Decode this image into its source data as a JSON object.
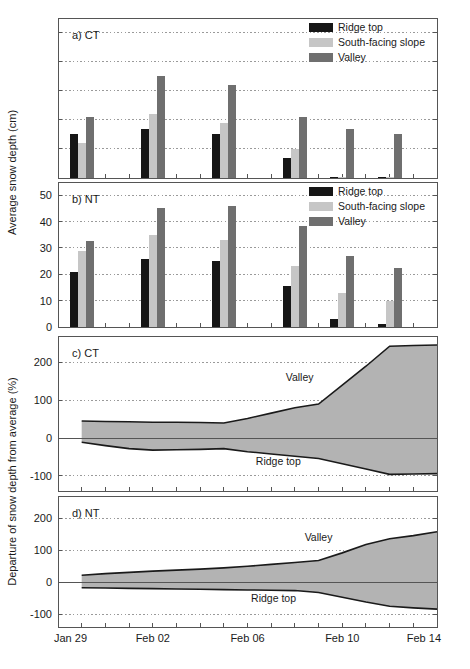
{
  "figure": {
    "width": 470,
    "height": 669,
    "ylabel_top": "Average snow depth (cm)",
    "ylabel_bottom": "Departure of snow depth from average (%)",
    "x_tick_labels": [
      "Jan 29",
      "Feb 02",
      "Feb 06",
      "Feb 10",
      "Feb 14"
    ],
    "x_tick_days": [
      0,
      4,
      8,
      12,
      16
    ],
    "x_range": [
      0,
      16
    ]
  },
  "colors": {
    "ridge_top": "#161616",
    "south_facing_slope": "#c6c6c6",
    "valley": "#6f6f6f",
    "band_fill": "#b3b3b3",
    "band_line": "#1a1a1a",
    "frame": "#555555",
    "grid": "#9a9a9a",
    "zero_line": "#555555"
  },
  "legend": {
    "entries": [
      {
        "label": "Ridge top",
        "color_key": "ridge_top"
      },
      {
        "label": "South-facing slope",
        "color_key": "south_facing_slope"
      },
      {
        "label": "Valley",
        "color_key": "valley"
      }
    ]
  },
  "chart_data": [
    {
      "id": "panel-a",
      "type": "bar",
      "title": "a) CT",
      "panel_label": "a) CT",
      "xlabel": "",
      "ylabel": "Average snow depth (cm)",
      "ylim": [
        0,
        55
      ],
      "yticks": [
        0,
        10,
        20,
        30,
        40,
        50
      ],
      "ytick_labels_visible": false,
      "grid": true,
      "legend_position": "top-right",
      "categories": [
        "Jan 30",
        "Feb 02",
        "Feb 05",
        "Feb 08",
        "Feb 11",
        "Feb 13"
      ],
      "category_days": [
        1,
        4,
        7,
        10,
        12,
        14
      ],
      "series": [
        {
          "name": "Ridge top",
          "color_key": "ridge_top",
          "values": [
            15,
            17,
            15,
            7,
            0.4,
            0.5
          ]
        },
        {
          "name": "South-facing slope",
          "color_key": "south_facing_slope",
          "values": [
            12,
            22,
            19,
            10,
            0.3,
            0.3
          ]
        },
        {
          "name": "Valley",
          "color_key": "valley",
          "values": [
            21,
            35,
            32,
            21,
            17,
            15
          ]
        }
      ]
    },
    {
      "id": "panel-b",
      "type": "bar",
      "title": "b) NT",
      "panel_label": "b) NT",
      "xlabel": "",
      "ylabel": "Average snow depth (cm)",
      "ylim": [
        0,
        55
      ],
      "yticks": [
        0,
        10,
        20,
        30,
        40,
        50
      ],
      "ytick_labels_visible": true,
      "grid": true,
      "legend_position": "top-right",
      "categories": [
        "Jan 30",
        "Feb 02",
        "Feb 05",
        "Feb 08",
        "Feb 11",
        "Feb 13"
      ],
      "category_days": [
        1,
        4,
        7,
        10,
        12,
        14
      ],
      "series": [
        {
          "name": "Ridge top",
          "color_key": "ridge_top",
          "values": [
            21,
            25.8,
            25,
            15.4,
            3,
            1.2
          ]
        },
        {
          "name": "South-facing slope",
          "color_key": "south_facing_slope",
          "values": [
            29,
            35,
            33,
            23,
            13,
            10
          ]
        },
        {
          "name": "Valley",
          "color_key": "valley",
          "values": [
            32.5,
            45,
            46,
            38.3,
            27,
            22.2
          ]
        }
      ]
    },
    {
      "id": "panel-c",
      "type": "area",
      "title": "c) CT",
      "panel_label": "c) CT",
      "xlabel": "",
      "ylabel": "Departure of snow depth from average (%)",
      "ylim": [
        -140,
        270
      ],
      "yticks": [
        -100,
        0,
        100,
        200
      ],
      "grid": true,
      "annotations": [
        {
          "text": "Valley",
          "x_day": 10.2,
          "y": 150
        },
        {
          "text": "Ridge top",
          "x_day": 9.3,
          "y": -70
        }
      ],
      "x": [
        1,
        2,
        3,
        4,
        5,
        6,
        7,
        8,
        9,
        10,
        11,
        12,
        13,
        14,
        15,
        16
      ],
      "series": [
        {
          "name": "Valley",
          "values": [
            45,
            44,
            43,
            42,
            42,
            41,
            40,
            52,
            66,
            80,
            90,
            140,
            190,
            243,
            245,
            246
          ]
        },
        {
          "name": "Ridge top",
          "values": [
            -11,
            -20,
            -28,
            -32,
            -31,
            -30,
            -28,
            -36,
            -42,
            -48,
            -54,
            -68,
            -82,
            -96,
            -95,
            -94
          ]
        }
      ]
    },
    {
      "id": "panel-d",
      "type": "area",
      "title": "d) NT",
      "panel_label": "d) NT",
      "xlabel": "",
      "ylabel": "Departure of snow depth from average (%)",
      "ylim": [
        -140,
        270
      ],
      "yticks": [
        -100,
        0,
        100,
        200
      ],
      "grid": true,
      "annotations": [
        {
          "text": "Valley",
          "x_day": 11.0,
          "y": 128
        },
        {
          "text": "Ridge top",
          "x_day": 9.1,
          "y": -62
        }
      ],
      "x": [
        1,
        2,
        3,
        4,
        5,
        6,
        7,
        8,
        9,
        10,
        11,
        12,
        13,
        14,
        15,
        16
      ],
      "series": [
        {
          "name": "Valley",
          "values": [
            22,
            27,
            31,
            35,
            38,
            41,
            45,
            50,
            56,
            62,
            68,
            92,
            118,
            136,
            146,
            158
          ]
        },
        {
          "name": "Ridge top",
          "values": [
            -17,
            -18,
            -19,
            -20,
            -21,
            -22,
            -23,
            -24,
            -25,
            -26,
            -32,
            -47,
            -62,
            -75,
            -80,
            -84
          ]
        }
      ]
    }
  ]
}
